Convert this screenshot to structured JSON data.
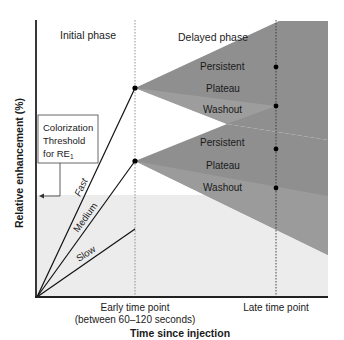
{
  "axes": {
    "y_label": "Relative enhancement (%)",
    "x_label": "Time since injection",
    "early_time_point": "Early time point",
    "early_time_point_sub": "(between 60–120 seconds)",
    "late_time_point": "Late time point"
  },
  "phases": {
    "initial": "Initial phase",
    "delayed": "Delayed phase"
  },
  "threshold_box": {
    "line1": "Colorization",
    "line2": "Threshold",
    "line3_prefix": "for RE",
    "line3_subscript": "1"
  },
  "initial_curves": [
    {
      "label": "Fast"
    },
    {
      "label": "Medium"
    },
    {
      "label": "Slow"
    }
  ],
  "upper_fan": {
    "labels": [
      "Persistent",
      "Plateau",
      "Washout"
    ]
  },
  "lower_fan": {
    "labels": [
      "Persistent",
      "Plateau",
      "Washout"
    ]
  },
  "colors": {
    "fan_dark": "#8f8f8f",
    "fan_mid": "#9a9a9a",
    "fan_light": "#a6a6a6",
    "threshold_band": "#ececec",
    "axis": "#222222",
    "text": "#1a1a1a"
  }
}
